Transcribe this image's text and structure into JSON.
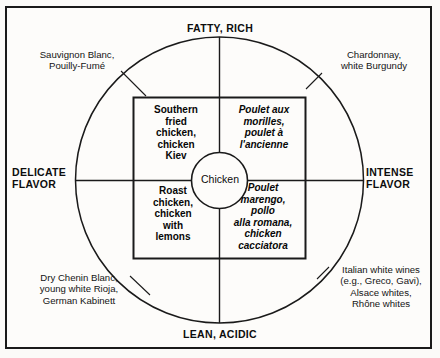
{
  "diagram": {
    "axes": {
      "top": "FATTY, RICH",
      "bottom": "LEAN, ACIDIC",
      "left": "DELICATE\nFLAVOR",
      "right": "INTENSE\nFLAVOR"
    },
    "center": {
      "label": "Chicken"
    },
    "food_quadrants": [
      {
        "position": "top-left",
        "style": "bold",
        "text": "Southern\nfried\nchicken,\nchicken\nKiev"
      },
      {
        "position": "top-right",
        "style": "bold-italic",
        "text": "Poulet aux\nmorilles,\npoulet à\nl'ancienne"
      },
      {
        "position": "bottom-left",
        "style": "bold",
        "text": "Roast\nchicken,\nchicken\nwith\nlemons"
      },
      {
        "position": "bottom-right",
        "style": "bold-italic-mixed",
        "text": "Poulet\nmarengo,\npollo\nalla romana,\nchicken\ncacciatora"
      }
    ],
    "wine_notes": [
      {
        "position": "top-left",
        "text": "Sauvignon Blanc,\nPouilly-Fumé"
      },
      {
        "position": "top-right",
        "text": "Chardonnay,\nwhite Burgundy"
      },
      {
        "position": "bottom-left",
        "text": "Dry Chenin Blanc,\nyoung white Rioja,\nGerman Kabinett"
      },
      {
        "position": "bottom-right",
        "text": "Italian white wines\n(e.g., Greco, Gavi),\nAlsace whites,\nRhône whites"
      }
    ],
    "colors": {
      "ink": "#1a1a1a",
      "paper": "#fdfcfa"
    }
  }
}
